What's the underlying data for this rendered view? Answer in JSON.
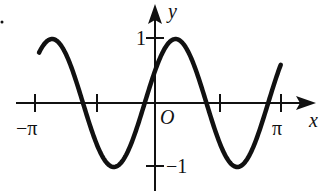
{
  "chart_data": {
    "type": "line",
    "title": "",
    "function": "y = sin(2x + π/6)",
    "xlabel": "x",
    "ylabel": "y",
    "origin_label": "O",
    "x_tick_labels": [
      "−π",
      "π"
    ],
    "x_ticks": [
      "-π",
      "-π/2",
      "π/2",
      "π"
    ],
    "y_tick_labels": [
      "1",
      "−1"
    ],
    "y_ticks": [
      1,
      -1
    ],
    "xlim": [
      -3.14159,
      3.0
    ],
    "ylim": [
      -1,
      1
    ],
    "grid": false,
    "legend": null,
    "series": [
      {
        "name": "curve",
        "x": [
          -3.14,
          -2.88,
          -2.62,
          -2.36,
          -2.09,
          -1.83,
          -1.57,
          -1.31,
          -1.05,
          -0.79,
          -0.52,
          -0.26,
          0.0,
          0.26,
          0.52,
          0.79,
          1.05,
          1.31,
          1.57,
          1.83,
          2.09,
          2.36,
          2.62,
          2.88,
          3.0
        ],
        "values": [
          0.5,
          0.87,
          1.0,
          0.87,
          0.5,
          0.0,
          -0.5,
          -0.87,
          -1.0,
          -0.87,
          -0.5,
          0.0,
          0.5,
          0.87,
          1.0,
          0.87,
          0.5,
          0.0,
          -0.5,
          -0.87,
          -1.0,
          -0.87,
          -0.5,
          0.0,
          0.24
        ]
      }
    ]
  },
  "labels": {
    "x_axis": "x",
    "y_axis": "y",
    "origin": "O",
    "neg_pi": "−π",
    "pi": "π",
    "one": "1",
    "neg_one": "−1"
  },
  "colors": {
    "stroke": "#111111",
    "background": "#ffffff"
  }
}
